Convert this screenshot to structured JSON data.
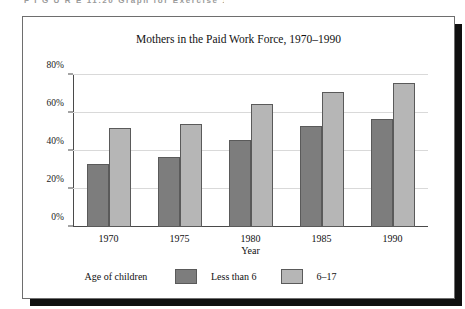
{
  "figure_caption_sliver": "F I G U R E   11.20    Graph for Exercise 11.9",
  "chart_data": {
    "type": "bar",
    "title": "Mothers in the Paid Work Force, 1970–1990",
    "xlabel": "Year",
    "ylabel": "",
    "categories": [
      "1970",
      "1975",
      "1980",
      "1985",
      "1990"
    ],
    "series": [
      {
        "name": "Less than 6",
        "color": "#7d7d7d",
        "values": [
          33,
          37,
          46,
          53,
          57
        ]
      },
      {
        "name": "6–17",
        "color": "#b6b6b6",
        "values": [
          52,
          54,
          65,
          71,
          76
        ]
      }
    ],
    "ylim": [
      0,
      80
    ],
    "yticks": [
      "0%",
      "20%",
      "40%",
      "60%",
      "80%"
    ],
    "ytick_values": [
      0,
      20,
      40,
      60,
      80
    ],
    "grid": true,
    "legend_position": "bottom",
    "legend_title": "Age of children"
  }
}
